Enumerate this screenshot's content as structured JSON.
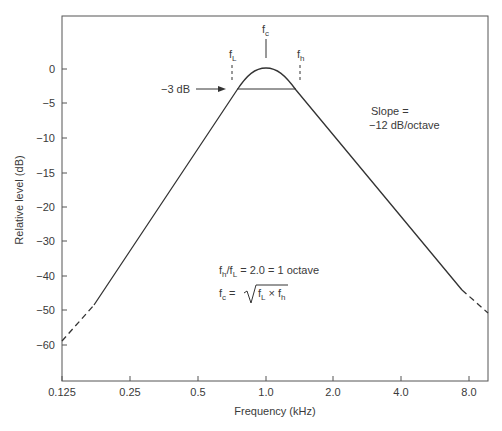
{
  "chart_data": {
    "type": "line",
    "title": "",
    "xlabel": "Frequency (kHz)",
    "ylabel": "Relative level (dB)",
    "x_scale": "log2",
    "x_ticks": [
      "0.125",
      "0.25",
      "0.5",
      "1.0",
      "2.0",
      "4.0",
      "8.0"
    ],
    "x_tick_values": [
      0.125,
      0.25,
      0.5,
      1.0,
      2.0,
      4.0,
      8.0
    ],
    "y_ticks": [
      "0",
      "−5",
      "−10",
      "−15",
      "−20",
      "−30",
      "−40",
      "−50",
      "−60"
    ],
    "y_tick_values": [
      0,
      -5,
      -10,
      -15,
      -20,
      -30,
      -40,
      -50,
      -60
    ],
    "grid": false,
    "legend": null,
    "series": [
      {
        "name": "Bandpass response",
        "style": "solid with dashed extrapolated tails",
        "points": [
          {
            "x": 0.125,
            "y": -48
          },
          {
            "x": 0.18,
            "y": -38
          },
          {
            "x": 0.707,
            "y": -3
          },
          {
            "x": 1.0,
            "y": 0
          },
          {
            "x": 1.414,
            "y": -3
          },
          {
            "x": 5.6,
            "y": -38
          },
          {
            "x": 8.6,
            "y": -49
          }
        ]
      }
    ],
    "annotations": [
      {
        "label": "f_c",
        "x": 1.0,
        "marker": "solid vertical tick above peak"
      },
      {
        "label": "f_L",
        "x": 0.707,
        "marker": "dashed vertical tick"
      },
      {
        "label": "f_h",
        "x": 1.414,
        "marker": "dashed vertical tick"
      },
      {
        "label": "−3 dB",
        "y": -3,
        "marker": "arrow pointing to -3 dB horizontal line between f_L and f_h"
      },
      {
        "label": "Slope = −12 dB/octave"
      },
      {
        "label": "f_h/f_L = 2.0 = 1 octave"
      },
      {
        "label": "f_c = √(f_L × f_h)"
      }
    ]
  },
  "labels": {
    "xlabel": "Frequency (kHz)",
    "ylabel": "Relative level (dB)",
    "fc": "f",
    "fc_sub": "c",
    "fl": "f",
    "fl_sub": "L",
    "fh": "f",
    "fh_sub": "h",
    "minus3db": "−3 dB",
    "slope_line1": "Slope =",
    "slope_line2": "−12 dB/octave",
    "ratio_f1": "f",
    "ratio_sub1": "h",
    "ratio_slash": "/f",
    "ratio_sub2": "L",
    "ratio_rest": " = 2.0 = 1 octave",
    "fc_formula_f": "f",
    "fc_formula_sub": "c",
    "fc_formula_eq": " = ",
    "sqrt_f1": "f",
    "sqrt_sub1": "L",
    "sqrt_times": " × f",
    "sqrt_sub2": "h"
  },
  "x_ticks": [
    {
      "label": "0.125",
      "px": 62
    },
    {
      "label": "0.25",
      "px": 130
    },
    {
      "label": "0.5",
      "px": 198
    },
    {
      "label": "1.0",
      "px": 266
    },
    {
      "label": "2.0",
      "px": 333
    },
    {
      "label": "4.0",
      "px": 401
    },
    {
      "label": "8.0",
      "px": 469
    }
  ],
  "y_ticks": [
    {
      "label": "0",
      "py": 69
    },
    {
      "label": "−5",
      "py": 103
    },
    {
      "label": "−10",
      "py": 138
    },
    {
      "label": "−15",
      "py": 173
    },
    {
      "label": "−20",
      "py": 207
    },
    {
      "label": "−30",
      "py": 241
    },
    {
      "label": "−40",
      "py": 276
    },
    {
      "label": "−50",
      "py": 310
    },
    {
      "label": "−60",
      "py": 345
    }
  ]
}
